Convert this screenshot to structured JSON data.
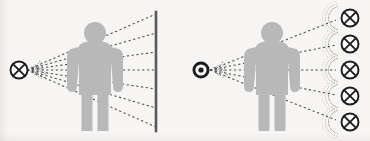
{
  "figure": {
    "background_color": "#f7f6f4",
    "ink_color": "#1c1c1c",
    "figure_fill": "#b9b9b9",
    "screen_color": "#5a5a5a",
    "ray_color": "#4a4a4a",
    "width": 370,
    "height": 141
  },
  "panels": [
    {
      "id": "left-panel",
      "name": "point-source-with-screen",
      "source": {
        "name": "point-light-source",
        "icon": "circle-x-icon",
        "style": "outlined-circle-with-cross",
        "cx": 19,
        "cy": 70,
        "r": 8.5
      },
      "subject": {
        "name": "human-figure-silhouette",
        "icon": "person-icon",
        "cx": 95,
        "head_cy": 33,
        "head_r": 11,
        "fill": "#b9b9b9"
      },
      "screen": {
        "name": "projection-screen",
        "x": 156,
        "y_top": 12,
        "y_bottom": 131,
        "stroke_width": 2.6,
        "color": "#5a5a5a"
      },
      "rays": {
        "name": "light-rays",
        "count": 7,
        "origin_x": 27,
        "origin_y": 70,
        "end_x": 156,
        "end_y_values": [
          14,
          33,
          52,
          70,
          89,
          108,
          127
        ],
        "dash": "2.2 2.6",
        "color": "#4a4a4a"
      },
      "emission_fan": {
        "name": "source-emission-fan",
        "dots": 46,
        "angle_span_deg": 66
      }
    },
    {
      "id": "right-panel",
      "name": "point-source-with-multiple-targets",
      "source": {
        "name": "bullseye-light-source",
        "icon": "bullseye-icon",
        "style": "filled-ring-with-dot",
        "cx": 201,
        "cy": 70,
        "r_outer": 8.5,
        "r_ring": 5.6,
        "r_dot": 2.6
      },
      "subject": {
        "name": "human-figure-silhouette",
        "icon": "person-icon",
        "cx": 272,
        "head_cy": 33,
        "head_r": 11,
        "fill": "#b9b9b9"
      },
      "targets": {
        "name": "target-light-sources",
        "icon": "circle-x-icon",
        "count": 5,
        "cx": 350,
        "cy_values": [
          18,
          44,
          70,
          96,
          122
        ],
        "r": 8.5
      },
      "rays": {
        "name": "light-rays",
        "count": 5,
        "origin_x": 210,
        "origin_y": 70,
        "end_x": 336,
        "end_y_values": [
          20,
          45,
          70,
          95,
          120
        ],
        "dash": "2.2 2.6",
        "color": "#4a4a4a"
      },
      "target_arcs": {
        "name": "target-convergence-arcs",
        "dots_per_arc": 22,
        "arc_radius": 13,
        "angle_span_deg": 150
      },
      "emission_fan": {
        "name": "source-emission-fan",
        "dots": 40,
        "angle_span_deg": 58
      }
    }
  ]
}
